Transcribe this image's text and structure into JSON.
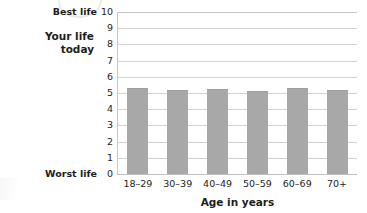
{
  "chart_data": {
    "type": "bar",
    "title": "",
    "subtitle": "",
    "xlabel": "Age in years",
    "ylabel": "Your life today",
    "ylabel_lines": [
      "Your life",
      "today"
    ],
    "categories": [
      "18–29",
      "30–39",
      "40–49",
      "50–59",
      "60–69",
      "70+"
    ],
    "values": [
      5.3,
      5.2,
      5.25,
      5.15,
      5.3,
      5.2
    ],
    "series": [
      {
        "name": "Your life today",
        "values": [
          5.3,
          5.2,
          5.25,
          5.15,
          5.3,
          5.2
        ]
      }
    ],
    "ylim": [
      0,
      10
    ],
    "ytick_labels": [
      "10",
      "9",
      "8",
      "7",
      "6",
      "5",
      "4",
      "3",
      "2",
      "1",
      "0"
    ],
    "ytick_values": [
      10,
      9,
      8,
      7,
      6,
      5,
      4,
      3,
      2,
      1,
      0
    ],
    "annotations": [
      {
        "name": "best-life",
        "text": "Best life",
        "at_value": 10
      },
      {
        "name": "worst-life",
        "text": "Worst life",
        "at_value": 0
      }
    ],
    "grid": true,
    "grid_axis": "y",
    "legend": false,
    "legend_position": "none",
    "colors": {
      "bar_fill": "#a8a8a8",
      "bar_edge": "#9e9e9e",
      "gridline": "#d2d2d2",
      "axis_line": "#c2c2c2",
      "text": "#1d1d1d",
      "background": "#ffffff"
    }
  }
}
